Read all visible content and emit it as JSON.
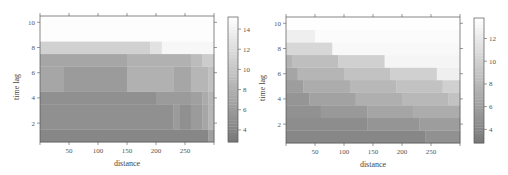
{
  "chart_data": [
    {
      "type": "heatmap",
      "title": "",
      "xlabel": "distance",
      "ylabel": "time lag",
      "xlim": [
        0,
        300
      ],
      "ylim": [
        0.5,
        10.5
      ],
      "xticks": [
        50,
        100,
        150,
        200,
        250
      ],
      "yticks": [
        2,
        4,
        6,
        8,
        10
      ],
      "colorbar": {
        "ticks": [
          4,
          6,
          8,
          10,
          12,
          14
        ],
        "range": [
          2.8,
          15.2
        ]
      },
      "colormap": "grey (dark = low, light = high)",
      "rows": [
        {
          "lag_range": [
            0.5,
            1.5
          ],
          "segments": [
            {
              "x": [
                0,
                290
              ],
              "value": 4.2
            },
            {
              "x": [
                290,
                300
              ],
              "value": 6.5
            }
          ]
        },
        {
          "lag_range": [
            1.5,
            3.5
          ],
          "segments": [
            {
              "x": [
                0,
                230
              ],
              "value": 5.0
            },
            {
              "x": [
                230,
                240
              ],
              "value": 6.0
            },
            {
              "x": [
                240,
                260
              ],
              "value": 5.0
            },
            {
              "x": [
                260,
                280
              ],
              "value": 6.0
            },
            {
              "x": [
                280,
                290
              ],
              "value": 7.0
            },
            {
              "x": [
                290,
                300
              ],
              "value": 8.5
            }
          ]
        },
        {
          "lag_range": [
            3.5,
            4.5
          ],
          "segments": [
            {
              "x": [
                0,
                200
              ],
              "value": 5.0
            },
            {
              "x": [
                200,
                260
              ],
              "value": 6.0
            },
            {
              "x": [
                260,
                280
              ],
              "value": 6.5
            },
            {
              "x": [
                280,
                290
              ],
              "value": 7.5
            },
            {
              "x": [
                290,
                300
              ],
              "value": 8.5
            }
          ]
        },
        {
          "lag_range": [
            4.5,
            6.5
          ],
          "segments": [
            {
              "x": [
                0,
                40
              ],
              "value": 7.0
            },
            {
              "x": [
                40,
                150
              ],
              "value": 6.0
            },
            {
              "x": [
                150,
                230
              ],
              "value": 8.0
            },
            {
              "x": [
                230,
                260
              ],
              "value": 7.0
            },
            {
              "x": [
                260,
                290
              ],
              "value": 8.5
            },
            {
              "x": [
                290,
                300
              ],
              "value": 9.5
            }
          ]
        },
        {
          "lag_range": [
            6.5,
            7.5
          ],
          "segments": [
            {
              "x": [
                0,
                150
              ],
              "value": 7.0
            },
            {
              "x": [
                150,
                260
              ],
              "value": 8.0
            },
            {
              "x": [
                260,
                280
              ],
              "value": 9.0
            },
            {
              "x": [
                280,
                300
              ],
              "value": 10.5
            }
          ]
        },
        {
          "lag_range": [
            7.5,
            8.5
          ],
          "segments": [
            {
              "x": [
                0,
                190
              ],
              "value": 11.0
            },
            {
              "x": [
                190,
                210
              ],
              "value": 12.5
            },
            {
              "x": [
                210,
                300
              ],
              "value": 14.5
            }
          ]
        },
        {
          "lag_range": [
            8.5,
            10.5
          ],
          "segments": [
            {
              "x": [
                0,
                300
              ],
              "value": 15.0
            }
          ]
        }
      ]
    },
    {
      "type": "heatmap",
      "title": "",
      "xlabel": "distance",
      "ylabel": "time lag",
      "xlim": [
        0,
        300
      ],
      "ylim": [
        0.5,
        10.5
      ],
      "xticks": [
        50,
        100,
        150,
        200,
        250
      ],
      "yticks": [
        2,
        4,
        6,
        8,
        10
      ],
      "colorbar": {
        "ticks": [
          4,
          6,
          8,
          10,
          12
        ],
        "range": [
          2.8,
          13.8
        ]
      },
      "colormap": "grey (dark = low, light = high)",
      "rows": [
        {
          "lag_range": [
            0.5,
            1.5
          ],
          "segments": [
            {
              "x": [
                0,
                240
              ],
              "value": 4.0
            },
            {
              "x": [
                240,
                300
              ],
              "value": 4.8
            }
          ]
        },
        {
          "lag_range": [
            1.5,
            2.5
          ],
          "segments": [
            {
              "x": [
                0,
                140
              ],
              "value": 4.5
            },
            {
              "x": [
                140,
                230
              ],
              "value": 5.2
            },
            {
              "x": [
                230,
                300
              ],
              "value": 5.8
            }
          ]
        },
        {
          "lag_range": [
            2.5,
            3.5
          ],
          "segments": [
            {
              "x": [
                0,
                60
              ],
              "value": 4.8
            },
            {
              "x": [
                60,
                140
              ],
              "value": 5.5
            },
            {
              "x": [
                140,
                220
              ],
              "value": 6.5
            },
            {
              "x": [
                220,
                300
              ],
              "value": 7.0
            }
          ]
        },
        {
          "lag_range": [
            3.5,
            4.5
          ],
          "segments": [
            {
              "x": [
                0,
                40
              ],
              "value": 5.2
            },
            {
              "x": [
                40,
                120
              ],
              "value": 6.2
            },
            {
              "x": [
                120,
                200
              ],
              "value": 7.3
            },
            {
              "x": [
                200,
                280
              ],
              "value": 8.0
            },
            {
              "x": [
                280,
                300
              ],
              "value": 8.8
            }
          ]
        },
        {
          "lag_range": [
            4.5,
            5.5
          ],
          "segments": [
            {
              "x": [
                0,
                30
              ],
              "value": 5.8
            },
            {
              "x": [
                30,
                110
              ],
              "value": 7.0
            },
            {
              "x": [
                110,
                190
              ],
              "value": 8.0
            },
            {
              "x": [
                190,
                270
              ],
              "value": 8.8
            },
            {
              "x": [
                270,
                300
              ],
              "value": 10.0
            }
          ]
        },
        {
          "lag_range": [
            5.5,
            6.5
          ],
          "segments": [
            {
              "x": [
                0,
                20
              ],
              "value": 6.5
            },
            {
              "x": [
                20,
                100
              ],
              "value": 7.8
            },
            {
              "x": [
                100,
                180
              ],
              "value": 8.8
            },
            {
              "x": [
                180,
                260
              ],
              "value": 10.0
            },
            {
              "x": [
                260,
                300
              ],
              "value": 12.5
            }
          ]
        },
        {
          "lag_range": [
            6.5,
            7.5
          ],
          "segments": [
            {
              "x": [
                0,
                10
              ],
              "value": 7.5
            },
            {
              "x": [
                10,
                90
              ],
              "value": 8.5
            },
            {
              "x": [
                90,
                170
              ],
              "value": 10.0
            },
            {
              "x": [
                170,
                300
              ],
              "value": 13.0
            }
          ]
        },
        {
          "lag_range": [
            7.5,
            8.5
          ],
          "segments": [
            {
              "x": [
                0,
                80
              ],
              "value": 10.5
            },
            {
              "x": [
                80,
                300
              ],
              "value": 13.2
            }
          ]
        },
        {
          "lag_range": [
            8.5,
            9.5
          ],
          "segments": [
            {
              "x": [
                0,
                50
              ],
              "value": 12.5
            },
            {
              "x": [
                50,
                300
              ],
              "value": 13.5
            }
          ]
        },
        {
          "lag_range": [
            9.5,
            10.5
          ],
          "segments": [
            {
              "x": [
                0,
                300
              ],
              "value": 13.7
            }
          ]
        }
      ]
    }
  ]
}
